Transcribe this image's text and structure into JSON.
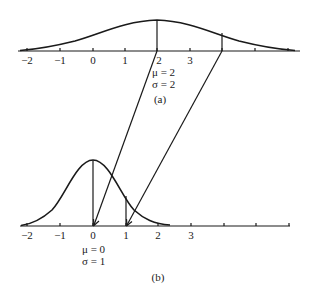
{
  "panel_a": {
    "caption": "(a)",
    "mu_label": "μ = 2",
    "sigma_label": "σ = 2",
    "tick_labels": [
      "−2",
      "−1",
      "0",
      "1",
      "2",
      "3"
    ],
    "mu": 2,
    "sigma": 2
  },
  "panel_b": {
    "caption": "(b)",
    "mu_label": "μ = 0",
    "sigma_label": "σ = 1",
    "tick_labels": [
      "−2",
      "−1",
      "0",
      "1",
      "2",
      "3"
    ],
    "mu": 0,
    "sigma": 1
  },
  "mappings": [
    {
      "from": "x = 2 (mean, panel a)",
      "to": "z = 0 (panel b)"
    },
    {
      "from": "x = 4 (mean + 1σ, panel a)",
      "to": "z = 1 (panel b)"
    }
  ],
  "colors": {
    "ink": "#1a1a1a",
    "background": "#ffffff"
  }
}
